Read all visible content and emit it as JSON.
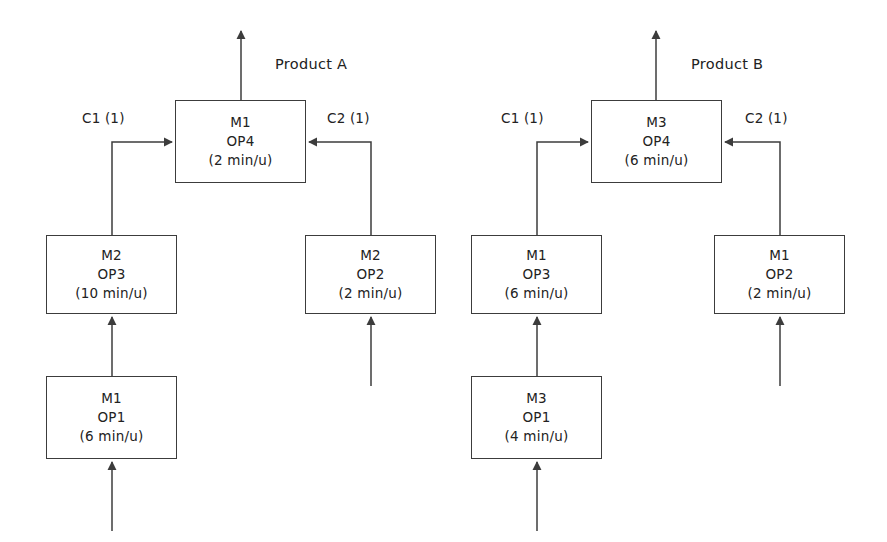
{
  "diagram": {
    "title_present": false,
    "stroke_color": "#3c3c3c",
    "text_color": "#222222",
    "background": "#ffffff",
    "products": [
      {
        "id": "product-a",
        "label": "Product A",
        "label_x": 275,
        "label_y": 62,
        "output_arrow_x": 241,
        "output_arrow_top": 30,
        "final_node": "a-m1-op4"
      },
      {
        "id": "product-b",
        "label": "Product B",
        "label_x": 691,
        "label_y": 62,
        "output_arrow_x": 656,
        "output_arrow_top": 30,
        "final_node": "b-m3-op4"
      }
    ],
    "nodes": [
      {
        "id": "a-m1-op4",
        "machine": "M1",
        "operation": "OP4",
        "time": "(2 min/u)",
        "x": 175,
        "y": 100,
        "w": 131,
        "h": 83
      },
      {
        "id": "a-m2-op3",
        "machine": "M2",
        "operation": "OP3",
        "time": "(10 min/u)",
        "x": 46,
        "y": 235,
        "w": 131,
        "h": 79
      },
      {
        "id": "a-m2-op2",
        "machine": "M2",
        "operation": "OP2",
        "time": "(2 min/u)",
        "x": 305,
        "y": 235,
        "w": 131,
        "h": 79
      },
      {
        "id": "a-m1-op1",
        "machine": "M1",
        "operation": "OP1",
        "time": "(6 min/u)",
        "x": 46,
        "y": 376,
        "w": 131,
        "h": 83
      },
      {
        "id": "b-m3-op4",
        "machine": "M3",
        "operation": "OP4",
        "time": "(6 min/u)",
        "x": 591,
        "y": 100,
        "w": 131,
        "h": 83
      },
      {
        "id": "b-m1-op3",
        "machine": "M1",
        "operation": "OP3",
        "time": "(6 min/u)",
        "x": 471,
        "y": 235,
        "w": 131,
        "h": 79
      },
      {
        "id": "b-m1-op2",
        "machine": "M1",
        "operation": "OP2",
        "time": "(2 min/u)",
        "x": 714,
        "y": 235,
        "w": 131,
        "h": 79
      },
      {
        "id": "b-m3-op1",
        "machine": "M3",
        "operation": "OP1",
        "time": "(4 min/u)",
        "x": 471,
        "y": 376,
        "w": 131,
        "h": 83
      }
    ],
    "edge_labels": [
      {
        "id": "a-c1",
        "text": "C1 (1)",
        "x": 82,
        "y": 112
      },
      {
        "id": "a-c2",
        "text": "C2 (1)",
        "x": 327,
        "y": 112
      },
      {
        "id": "b-c1",
        "text": "C1 (1)",
        "x": 501,
        "y": 112
      },
      {
        "id": "b-c2",
        "text": "C2 (1)",
        "x": 745,
        "y": 112
      }
    ],
    "connections": [
      {
        "id": "a-c1-edge",
        "from": "a-m2-op3",
        "to": "a-m1-op4",
        "label": "C1 (1)",
        "type": "elbow-right"
      },
      {
        "id": "a-c2-edge",
        "from": "a-m2-op2",
        "to": "a-m1-op4",
        "label": "C2 (1)",
        "type": "elbow-left"
      },
      {
        "id": "a-op1-op3-edge",
        "from": "a-m1-op1",
        "to": "a-m2-op3",
        "label": "",
        "type": "vertical"
      },
      {
        "id": "a-raw-op1-edge",
        "from": "raw-material",
        "to": "a-m1-op1",
        "label": "",
        "type": "vertical"
      },
      {
        "id": "a-raw-op2-edge",
        "from": "raw-material",
        "to": "a-m2-op2",
        "label": "",
        "type": "vertical"
      },
      {
        "id": "b-c1-edge",
        "from": "b-m1-op3",
        "to": "b-m3-op4",
        "label": "C1 (1)",
        "type": "elbow-right"
      },
      {
        "id": "b-c2-edge",
        "from": "b-m1-op2",
        "to": "b-m3-op4",
        "label": "C2 (1)",
        "type": "elbow-left"
      },
      {
        "id": "b-op1-op3-edge",
        "from": "b-m3-op1",
        "to": "b-m1-op3",
        "label": "",
        "type": "vertical"
      },
      {
        "id": "b-raw-op1-edge",
        "from": "raw-material",
        "to": "b-m3-op1",
        "label": "",
        "type": "vertical"
      },
      {
        "id": "b-raw-op2-edge",
        "from": "raw-material",
        "to": "b-m1-op2",
        "label": "",
        "type": "vertical"
      }
    ]
  }
}
